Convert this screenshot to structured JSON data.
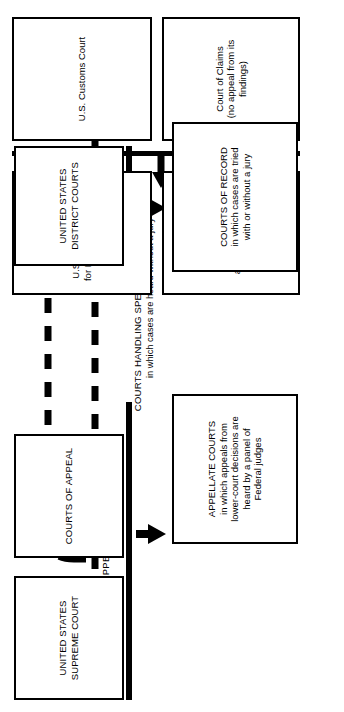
{
  "diagram": {
    "title_block": {
      "line1": "COURTS HANDLING SPECIAL TYPES OF CASES",
      "line2": "in which cases are heard without a jury"
    },
    "special_courts": [
      {
        "id": "us-customs-court",
        "label": "U.S. Customs Court"
      },
      {
        "id": "court-of-claims",
        "label": "Court of Claims\n(no appeal from its findings)"
      },
      {
        "id": "us-court-appeals-dc",
        "label": "U.S. Court of Appeals\nfor District of Columbia"
      },
      {
        "id": "court-customs-patent",
        "label": "Court of Customs\nand Patent Appeals"
      }
    ],
    "court_boxes": [
      {
        "id": "united-states-supreme-court",
        "label": "UNITED STATES\nSUPREME COURT"
      },
      {
        "id": "courts-of-appeal",
        "label": "COURTS OF APPEAL"
      },
      {
        "id": "united-states-district-courts",
        "label": "UNITED STATES\nDISTRICT COURTS"
      }
    ],
    "description_boxes": [
      {
        "id": "appellate-courts",
        "label": "APPELLATE COURTS\nin which appeals from\nlower-court decisions are\nheard by a panel of\nFederal judges"
      },
      {
        "id": "courts-of-record",
        "label": "COURTS OF RECORD\nin which cases are tried\nwith or without a jury"
      }
    ],
    "appeal_labels": [
      {
        "id": "appeal-left",
        "label": "APPEAL"
      },
      {
        "id": "appeal-right",
        "label": "APPEAL"
      }
    ],
    "colors": {
      "ink": "#000000",
      "paper": "#ffffff"
    }
  }
}
